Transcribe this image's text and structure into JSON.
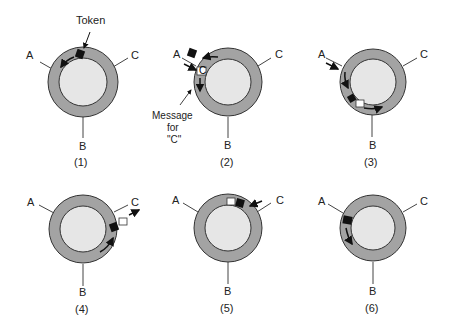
{
  "colors": {
    "ring": "#a3a3a3",
    "ring_stroke": "#333333",
    "inner": "#e6e6e6",
    "token": "#111111",
    "message": "#ffffff",
    "line": "#444444"
  },
  "callouts": {
    "token": "Token",
    "message_line1": "Message",
    "message_line2": "for",
    "message_line3": "\"C\""
  },
  "stations": {
    "a": "A",
    "b": "B",
    "c": "C"
  },
  "message_glyph": "C",
  "panels": [
    {
      "label": "(1)",
      "state": "token circulating counter-clockwise near top"
    },
    {
      "label": "(2)",
      "state": "station A seizes token and inserts message for C"
    },
    {
      "label": "(3)",
      "state": "token and message travel toward B"
    },
    {
      "label": "(4)",
      "state": "message reaches C and is copied out"
    },
    {
      "label": "(5)",
      "state": "frame returns toward A"
    },
    {
      "label": "(6)",
      "state": "A releases token"
    }
  ]
}
